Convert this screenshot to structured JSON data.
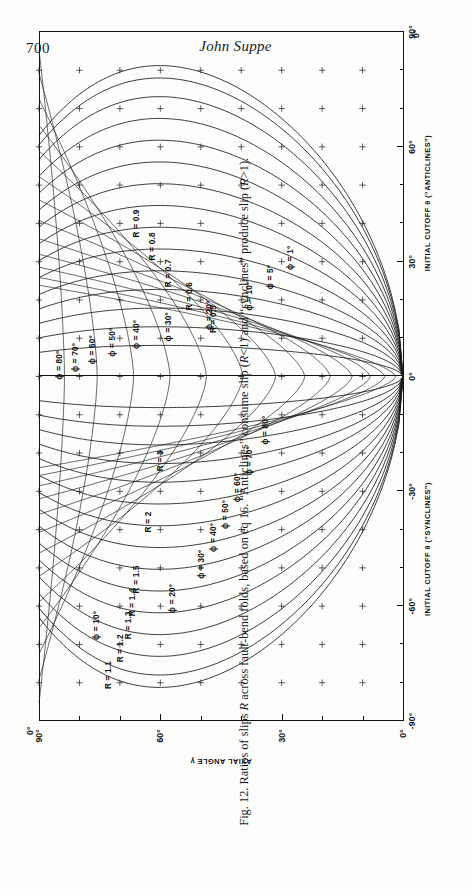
{
  "page": {
    "number": "700",
    "running_head": "John Suppe"
  },
  "caption": {
    "figure_label": "Fig. 12.",
    "text_part1": "Ratios of slips ",
    "italic_R_1": "R",
    "text_part2": " across fault-bend folds, based on eq 16. “Anticlines” consume slip (",
    "italic_R_2": "R",
    "text_part3": "<1) and “synclines” produce slip (",
    "italic_R_3": "R",
    "text_part4": ">1).",
    "full": "Fig. 12. Ratios of slips R across fault-bend folds, based on eq 16. “Anticlines” consume slip (R<1) and “synclines” produce slip (R>1)."
  },
  "chart_data": {
    "type": "line",
    "title": "Fig. 12. Ratios of slips R across fault-bend folds",
    "orientation_on_page": "rotated-90-counterclockwise",
    "xlabel_left_half": "INITIAL CUTOFF θ (“SYNCLINES”)",
    "xlabel_right_half": "INITIAL CUTOFF θ (“ANTICLINES”)",
    "ylabel": "AXIAL ANGLE γ",
    "xlim": [
      -90,
      90
    ],
    "ylim": [
      0,
      90
    ],
    "grid": false,
    "x_ticks_major": [
      -90,
      -60,
      -30,
      0,
      30,
      60,
      90
    ],
    "x_tick_labels_major": [
      "-90°",
      "-60°",
      "-30°",
      "0°",
      "30°",
      "60°",
      "90°"
    ],
    "x_ticks_minor": [
      -80,
      -70,
      -50,
      -40,
      -20,
      -10,
      10,
      20,
      40,
      50,
      70,
      80
    ],
    "y_ticks_major": [
      0,
      30,
      60,
      90
    ],
    "y_tick_labels_major": [
      "0°",
      "30°",
      "60°",
      "90°"
    ],
    "y_ticks_minor": [
      10,
      20,
      40,
      50,
      70,
      80
    ],
    "corner_labels": {
      "top_left": "0°",
      "top_left_outer": "90°",
      "bottom_right": "0°",
      "bottom_right_outer": "90°"
    },
    "series": [
      {
        "name": "R = 1.1",
        "family": "R",
        "value": 1.1,
        "label": "R = 1.1"
      },
      {
        "name": "R = 1.2",
        "family": "R",
        "value": 1.2,
        "label": "R = 1.2"
      },
      {
        "name": "R = 1.3",
        "family": "R",
        "value": 1.3,
        "label": "R = 1.3"
      },
      {
        "name": "R = 1.4",
        "family": "R",
        "value": 1.4,
        "label": "R = 1.4"
      },
      {
        "name": "R = 1.5",
        "family": "R",
        "value": 1.5,
        "label": "R = 1.5"
      },
      {
        "name": "R = 2",
        "family": "R",
        "value": 2.0,
        "label": "R = 2"
      },
      {
        "name": "R = 3",
        "family": "R",
        "value": 3.0,
        "label": "R = 3"
      },
      {
        "name": "R = 0.9",
        "family": "R",
        "value": 0.9,
        "label": "R = 0.9"
      },
      {
        "name": "R = 0.8",
        "family": "R",
        "value": 0.8,
        "label": "R = 0.8"
      },
      {
        "name": "R = 0.7",
        "family": "R",
        "value": 0.7,
        "label": "R = 0.7"
      },
      {
        "name": "R = 0.6",
        "family": "R",
        "value": 0.6,
        "label": "R = 0.6"
      },
      {
        "name": "R = 0.5",
        "family": "R",
        "value": 0.5,
        "label": "R = 0.5"
      },
      {
        "name": "ϕ = 1°",
        "family": "phi",
        "value": 1,
        "label": "ϕ = 1°"
      },
      {
        "name": "ϕ = 5°",
        "family": "phi",
        "value": 5,
        "label": "ϕ = 5°"
      },
      {
        "name": "ϕ = 10°",
        "family": "phi",
        "value": 10,
        "label": "ϕ = 10°"
      },
      {
        "name": "ϕ = 20°",
        "family": "phi",
        "value": 20,
        "label": "ϕ = 20°"
      },
      {
        "name": "ϕ = 30°",
        "family": "phi",
        "value": 30,
        "label": "ϕ = 30°"
      },
      {
        "name": "ϕ = 40°",
        "family": "phi",
        "value": 40,
        "label": "ϕ = 40°"
      },
      {
        "name": "ϕ = 50°",
        "family": "phi",
        "value": 50,
        "label": "ϕ = 50°"
      },
      {
        "name": "ϕ = 60°",
        "family": "phi",
        "value": 60,
        "label": "ϕ = 60°"
      },
      {
        "name": "ϕ = 70°",
        "family": "phi",
        "value": 70,
        "label": "ϕ = 70°"
      },
      {
        "name": "ϕ = 80°",
        "family": "phi",
        "value": 80,
        "label": "ϕ = 80°"
      }
    ],
    "curve_labels_syncline": [
      {
        "text": "R = 1.1",
        "x": -78,
        "y": 73
      },
      {
        "text": "R = 1.2",
        "x": -71,
        "y": 70
      },
      {
        "text": "R = 1.3",
        "x": -65,
        "y": 68
      },
      {
        "text": "R = 1.4",
        "x": -59,
        "y": 67
      },
      {
        "text": "R = 1.5",
        "x": -53,
        "y": 66
      },
      {
        "text": "R = 2",
        "x": -38,
        "y": 63
      },
      {
        "text": "R = 3",
        "x": -22,
        "y": 60
      },
      {
        "text": "ϕ = 10°",
        "x": -65,
        "y": 76
      },
      {
        "text": "ϕ = 20°",
        "x": -58,
        "y": 57
      },
      {
        "text": "ϕ = 30°",
        "x": -49,
        "y": 50
      },
      {
        "text": "ϕ = 40°",
        "x": -42,
        "y": 47
      },
      {
        "text": "ϕ = 50°",
        "x": -36,
        "y": 44
      },
      {
        "text": "ϕ = 60°",
        "x": -29,
        "y": 41
      },
      {
        "text": "ϕ = 70°",
        "x": -22,
        "y": 38
      },
      {
        "text": "ϕ = 80°",
        "x": -14,
        "y": 34
      }
    ],
    "curve_labels_anticline": [
      {
        "text": "R = 0.9",
        "x": 40,
        "y": 66
      },
      {
        "text": "R = 0.8",
        "x": 34,
        "y": 62
      },
      {
        "text": "R = 0.7",
        "x": 27,
        "y": 58
      },
      {
        "text": "R = 0.6",
        "x": 21,
        "y": 53
      },
      {
        "text": "R = 0.5",
        "x": 15,
        "y": 47
      },
      {
        "text": "ϕ = 1°",
        "x": 31,
        "y": 28
      },
      {
        "text": "ϕ = 5°",
        "x": 26,
        "y": 33
      },
      {
        "text": "ϕ = 10°",
        "x": 21,
        "y": 38
      },
      {
        "text": "ϕ = 20°",
        "x": 16,
        "y": 48
      },
      {
        "text": "ϕ = 30°",
        "x": 13,
        "y": 58
      },
      {
        "text": "ϕ = 40°",
        "x": 11,
        "y": 66
      },
      {
        "text": "ϕ = 50°",
        "x": 9,
        "y": 72
      },
      {
        "text": "ϕ = 60°",
        "x": 7,
        "y": 77
      },
      {
        "text": "ϕ = 70°",
        "x": 5,
        "y": 81
      },
      {
        "text": "ϕ = 80°",
        "x": 3,
        "y": 85
      }
    ]
  }
}
